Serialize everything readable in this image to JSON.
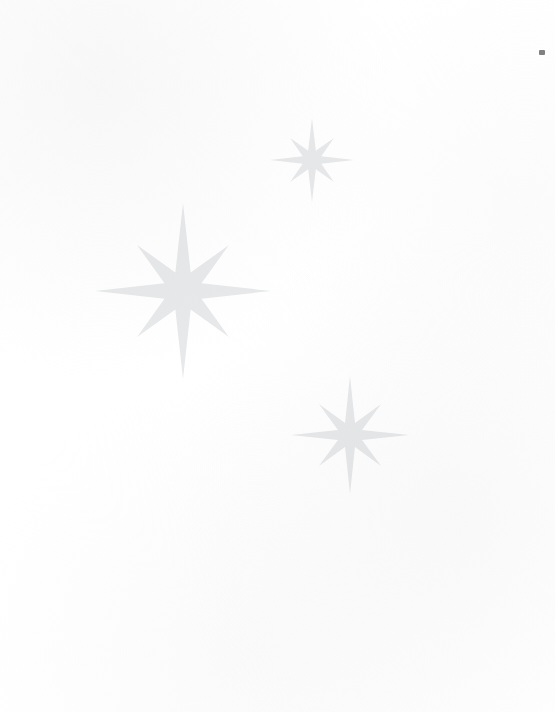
{
  "artwork": {
    "title": "Eight-pointed stars",
    "canvas": {
      "width": 555,
      "height": 712
    },
    "background_color": "#ffffff",
    "star_fill_color": "#e8e9ea",
    "mark_color": "#808080"
  },
  "stars": [
    {
      "name": "star-large-left",
      "label": "Large star",
      "center_x": 183,
      "center_y": 291,
      "outer_radius": 88,
      "mid_radius": 65,
      "inner_radius": 20,
      "rotation": 0
    },
    {
      "name": "star-small-top",
      "label": "Small top star",
      "center_x": 312,
      "center_y": 160,
      "outer_radius": 42,
      "mid_radius": 31,
      "inner_radius": 10,
      "rotation": 0
    },
    {
      "name": "star-medium-bottom",
      "label": "Medium bottom star",
      "center_x": 350,
      "center_y": 435,
      "outer_radius": 59,
      "mid_radius": 44,
      "inner_radius": 13,
      "rotation": 0
    }
  ],
  "corner_mark": {
    "name": "corner-registration-mark",
    "x": 539,
    "y": 50,
    "width": 6,
    "height": 5,
    "color": "#808080"
  }
}
